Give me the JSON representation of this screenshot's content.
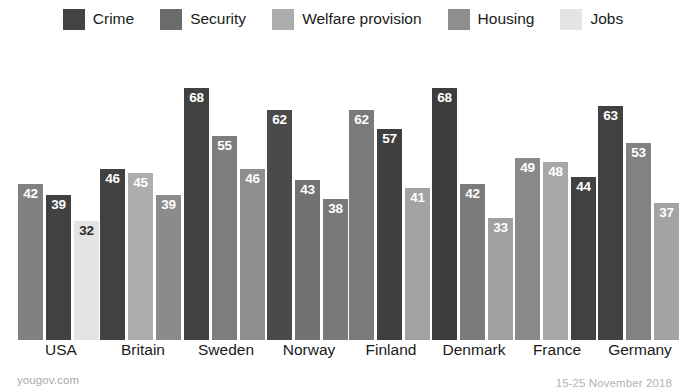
{
  "footer": {
    "source": "yougov.com",
    "fieldwork_dates": "15-25 November 2018"
  },
  "legend": {
    "position": "top-center",
    "items": [
      {
        "label": "Crime",
        "color": "#434343",
        "key": "crime"
      },
      {
        "label": "Security",
        "color": "#6b6b6b",
        "key": "security"
      },
      {
        "label": "Welfare provision",
        "color": "#adadad",
        "key": "welfare"
      },
      {
        "label": "Housing",
        "color": "#8e8e8e",
        "key": "housing"
      },
      {
        "label": "Jobs",
        "color": "#e4e4e4",
        "key": "jobs"
      }
    ]
  },
  "chart_data": {
    "type": "bar",
    "title": "",
    "subtitle": "",
    "xlabel": "",
    "ylabel": "",
    "grid": false,
    "ylim": [
      0,
      72
    ],
    "legend_position": "top-center",
    "categories": [
      "USA",
      "Britain",
      "Sweden",
      "Norway",
      "Finland",
      "Denmark",
      "France",
      "Germany"
    ],
    "groups": [
      {
        "category": "USA",
        "bars": [
          {
            "series": "Security",
            "value": 42,
            "color": "#818181",
            "label_on": "dark"
          },
          {
            "series": "Crime",
            "value": 39,
            "color": "#414141",
            "label_on": "dark"
          },
          {
            "series": "Jobs",
            "value": 32,
            "color": "#e4e4e4",
            "label_on": "light"
          }
        ]
      },
      {
        "category": "Britain",
        "bars": [
          {
            "series": "Crime",
            "value": 46,
            "color": "#414141",
            "label_on": "dark"
          },
          {
            "series": "Welfare provision",
            "value": 45,
            "color": "#adadad",
            "label_on": "dark"
          },
          {
            "series": "Housing",
            "value": 39,
            "color": "#8b8b8b",
            "label_on": "dark"
          }
        ]
      },
      {
        "category": "Sweden",
        "bars": [
          {
            "series": "Crime",
            "value": 68,
            "color": "#414141",
            "label_on": "dark"
          },
          {
            "series": "Security",
            "value": 55,
            "color": "#7d7d7d",
            "label_on": "dark"
          },
          {
            "series": "Housing",
            "value": 46,
            "color": "#8e8e8e",
            "label_on": "dark"
          }
        ]
      },
      {
        "category": "Norway",
        "bars": [
          {
            "series": "Crime",
            "value": 62,
            "color": "#4a4a4a",
            "label_on": "dark"
          },
          {
            "series": "Security",
            "value": 43,
            "color": "#727272",
            "label_on": "dark"
          },
          {
            "series": "Housing",
            "value": 38,
            "color": "#797979",
            "label_on": "dark"
          }
        ]
      },
      {
        "category": "Finland",
        "bars": [
          {
            "series": "Security",
            "value": 62,
            "color": "#7a7a7a",
            "label_on": "dark"
          },
          {
            "series": "Crime",
            "value": 57,
            "color": "#3f3f3f",
            "label_on": "dark"
          },
          {
            "series": "Welfare provision",
            "value": 41,
            "color": "#a2a2a2",
            "label_on": "dark"
          }
        ]
      },
      {
        "category": "Denmark",
        "bars": [
          {
            "series": "Crime",
            "value": 68,
            "color": "#3d3d3d",
            "label_on": "dark"
          },
          {
            "series": "Security",
            "value": 42,
            "color": "#7b7b7b",
            "label_on": "dark"
          },
          {
            "series": "Welfare provision",
            "value": 33,
            "color": "#a0a0a0",
            "label_on": "dark"
          }
        ]
      },
      {
        "category": "France",
        "bars": [
          {
            "series": "Security",
            "value": 49,
            "color": "#8a8a8a",
            "label_on": "dark"
          },
          {
            "series": "Welfare provision",
            "value": 48,
            "color": "#a8a8a8",
            "label_on": "dark"
          },
          {
            "series": "Crime",
            "value": 44,
            "color": "#414141",
            "label_on": "dark"
          }
        ]
      },
      {
        "category": "Germany",
        "bars": [
          {
            "series": "Crime",
            "value": 63,
            "color": "#414141",
            "label_on": "dark"
          },
          {
            "series": "Security",
            "value": 53,
            "color": "#828282",
            "label_on": "dark"
          },
          {
            "series": "Welfare provision",
            "value": 37,
            "color": "#a3a3a3",
            "label_on": "dark"
          }
        ]
      }
    ]
  },
  "layout": {
    "group_left_positions": [
      18,
      100,
      184,
      267,
      349,
      432,
      515,
      598
    ],
    "group_label_centers": [
      61,
      143,
      226,
      309,
      391,
      474,
      557,
      640
    ],
    "plot_height_px": 300,
    "px_per_unit": 3.71,
    "bar_width_px": 25,
    "bar_gap_px": 3
  }
}
